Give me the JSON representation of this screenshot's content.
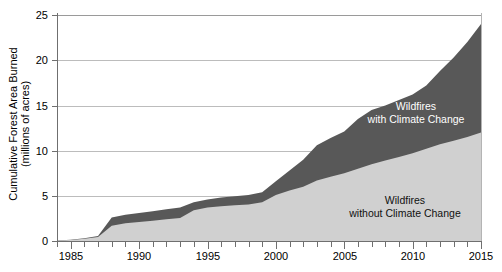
{
  "axes": {
    "y_title": "Cumulative Forest Area Burned\n(millions of acres)",
    "y_ticks": [
      "0",
      "5",
      "10",
      "15",
      "20",
      "25"
    ],
    "x_ticks": [
      "1985",
      "1990",
      "1995",
      "2000",
      "2005",
      "2010",
      "2015"
    ]
  },
  "annotations": {
    "upper": "Wildfires\nwith Climate Change",
    "lower": "Wildfires\nwithout Climate Change"
  },
  "colors": {
    "with_climate_change": "#585858",
    "without_climate_change": "#d0d0d0",
    "grid": "#bcbcbc",
    "axis": "#6f6f6f"
  },
  "chart_data": {
    "type": "area",
    "title": "",
    "subtitle": "",
    "xlabel": "",
    "ylabel": "Cumulative Forest Area Burned (millions of acres)",
    "xlim": [
      1984,
      2015
    ],
    "ylim": [
      0,
      25
    ],
    "grid": true,
    "stacked": false,
    "legend_position": "in-plot annotations",
    "x": [
      1984,
      1985,
      1986,
      1987,
      1988,
      1989,
      1990,
      1991,
      1992,
      1993,
      1994,
      1995,
      1996,
      1997,
      1998,
      1999,
      2000,
      2001,
      2002,
      2003,
      2004,
      2005,
      2006,
      2007,
      2008,
      2009,
      2010,
      2011,
      2012,
      2013,
      2014,
      2015
    ],
    "series": [
      {
        "name": "Wildfires with Climate Change",
        "color": "#585858",
        "values": [
          0.05,
          0.15,
          0.3,
          0.55,
          2.6,
          2.9,
          3.1,
          3.3,
          3.5,
          3.7,
          4.3,
          4.6,
          4.8,
          4.95,
          5.1,
          5.4,
          6.6,
          7.8,
          9.0,
          10.6,
          11.4,
          12.1,
          13.5,
          14.5,
          15.0,
          15.6,
          16.2,
          17.2,
          18.8,
          20.3,
          22.0,
          24.0
        ]
      },
      {
        "name": "Wildfires without Climate Change",
        "color": "#d0d0d0",
        "values": [
          0.05,
          0.12,
          0.25,
          0.45,
          1.7,
          1.95,
          2.1,
          2.25,
          2.4,
          2.55,
          3.4,
          3.7,
          3.85,
          3.95,
          4.05,
          4.3,
          5.1,
          5.6,
          6.0,
          6.7,
          7.1,
          7.5,
          8.0,
          8.5,
          8.9,
          9.3,
          9.7,
          10.2,
          10.7,
          11.1,
          11.5,
          12.0
        ]
      }
    ]
  }
}
